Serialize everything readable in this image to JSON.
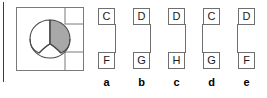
{
  "figure": {
    "panel": {
      "shape_name": "crescent-with-divider",
      "notch_top_right": true,
      "notch_bottom_right": true,
      "shaded_half": "right",
      "shade_color": "#a8a8a8",
      "outline_color": "#4a4a4a",
      "panel_border_color": "#7a7a7a"
    },
    "columns": [
      {
        "label": "a",
        "top_letter": "C",
        "bottom_letter": "F",
        "connector_side": "right"
      },
      {
        "label": "b",
        "top_letter": "D",
        "bottom_letter": "G",
        "connector_side": "right"
      },
      {
        "label": "c",
        "top_letter": "D",
        "bottom_letter": "H",
        "connector_side": "right"
      },
      {
        "label": "d",
        "top_letter": "C",
        "bottom_letter": "G",
        "connector_side": "left"
      },
      {
        "label": "e",
        "top_letter": "D",
        "bottom_letter": "F",
        "connector_side": "left"
      }
    ]
  }
}
